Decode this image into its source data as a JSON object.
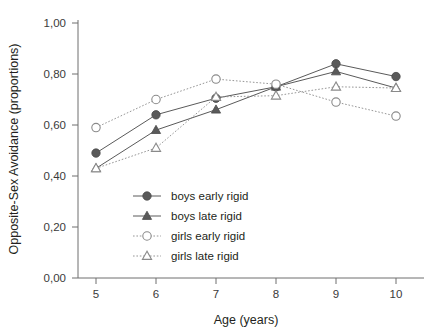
{
  "chart_data": {
    "type": "line",
    "title": "",
    "xlabel": "Age (years)",
    "ylabel": "Opposite-Sex Avoidance (proportions)",
    "categories": [
      5,
      6,
      7,
      8,
      9,
      10
    ],
    "x": [
      5,
      6,
      7,
      8,
      9,
      10
    ],
    "xtick_labels": [
      "5",
      "6",
      "7",
      "8",
      "9",
      "10"
    ],
    "ytick_labels": [
      "0,00",
      "0,20",
      "0,40",
      "0,60",
      "0,80",
      "1,00"
    ],
    "ytick_values": [
      0.0,
      0.2,
      0.4,
      0.6,
      0.8,
      1.0
    ],
    "ylim": [
      0.0,
      1.0
    ],
    "xlim": [
      4.5,
      10.5
    ],
    "grid": false,
    "legend_position": "center-left",
    "series": [
      {
        "name": "boys early rigid",
        "marker": "filled-circle",
        "line": "solid",
        "color": "#5a5a5a",
        "values": [
          0.49,
          0.64,
          0.705,
          0.75,
          0.84,
          0.79
        ]
      },
      {
        "name": "boys late rigid",
        "marker": "filled-triangle",
        "line": "solid",
        "color": "#5a5a5a",
        "values": [
          0.43,
          0.58,
          0.66,
          0.75,
          0.81,
          0.745
        ]
      },
      {
        "name": "girls early rigid",
        "marker": "open-circle",
        "line": "dotted",
        "color": "#8a8a8a",
        "values": [
          0.59,
          0.7,
          0.78,
          0.76,
          0.69,
          0.635
        ]
      },
      {
        "name": "girls late rigid",
        "marker": "open-triangle",
        "line": "dotted",
        "color": "#8a8a8a",
        "values": [
          0.43,
          0.51,
          0.71,
          0.715,
          0.75,
          0.745
        ]
      }
    ]
  },
  "axes": {
    "x_title": "Age (years)",
    "y_title": "Opposite-Sex Avoidance (proportions)"
  },
  "legend": {
    "items": [
      {
        "label": "boys early rigid"
      },
      {
        "label": "boys late rigid"
      },
      {
        "label": "girls early rigid"
      },
      {
        "label": "girls late rigid"
      }
    ]
  },
  "colors": {
    "filled": "#5a5a5a",
    "open_stroke": "#8a8a8a",
    "axis": "#6e6e6e",
    "text": "#231f20"
  }
}
